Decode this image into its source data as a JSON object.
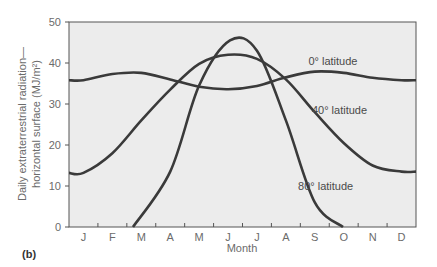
{
  "chart_data": {
    "type": "line",
    "title": "",
    "panel_label": "(b)",
    "xlabel": "Month",
    "ylabel_line1": "Daily extraterrestrial radiation—",
    "ylabel_line2": "horizontal surface (MJ/m²)",
    "ylim": [
      0,
      50
    ],
    "yticks": [
      0,
      10,
      20,
      30,
      40,
      50
    ],
    "categories": [
      "J",
      "F",
      "M",
      "A",
      "M",
      "J",
      "J",
      "A",
      "S",
      "O",
      "N",
      "D"
    ],
    "grid": false,
    "legend": "inline labels",
    "series": [
      {
        "name": "0° latitude",
        "label_pos": [
          0.69,
          39.5
        ],
        "values": [
          35.8,
          37.3,
          37.6,
          36.0,
          34.2,
          33.6,
          34.4,
          36.5,
          37.9,
          37.6,
          36.4,
          35.8
        ]
      },
      {
        "name": "40° latitude",
        "label_pos": [
          0.7,
          27.5
        ],
        "values": [
          13.2,
          18.0,
          26.0,
          33.5,
          39.8,
          42.0,
          41.0,
          36.0,
          28.0,
          20.5,
          15.0,
          13.5
        ]
      },
      {
        "name": "80° latitude",
        "label_pos": [
          0.66,
          9.0
        ],
        "values": [
          0,
          0,
          0,
          13.5,
          34.5,
          45.5,
          43.0,
          26.0,
          6.0,
          0,
          0,
          0
        ]
      }
    ]
  }
}
